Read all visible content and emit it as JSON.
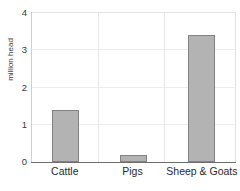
{
  "chart_data": {
    "type": "bar",
    "title": "",
    "xlabel": "",
    "ylabel": "million head",
    "categories": [
      "Cattle",
      "Pigs",
      "Sheep & Goats"
    ],
    "values": [
      1.4,
      0.2,
      3.4
    ],
    "series": [
      {
        "name": "million head",
        "values": [
          1.4,
          0.2,
          3.4
        ]
      }
    ],
    "ylim": [
      0,
      4
    ],
    "yticks": [
      0,
      1,
      2,
      3,
      4
    ],
    "ytick_labels": [
      "0",
      "1",
      "2",
      "3",
      "4"
    ],
    "grid": true,
    "grid_axis": "y",
    "legend": false,
    "legend_position": "none",
    "bar_color": "#b3b3b3",
    "bar_edge_color": "#838383",
    "grid_color": "#ededed",
    "axis_color": "#6e6e6e",
    "text_color": "#2b2b2b"
  },
  "axis": {
    "y_title": "million head",
    "ticks": [
      {
        "label": "4",
        "value": 4
      },
      {
        "label": "3",
        "value": 3
      },
      {
        "label": "2",
        "value": 2
      },
      {
        "label": "1",
        "value": 1
      },
      {
        "label": "0",
        "value": 0
      }
    ]
  },
  "bars": [
    {
      "label": "Cattle",
      "value": 1.4
    },
    {
      "label": "Pigs",
      "value": 0.2
    },
    {
      "label": "Sheep & Goats",
      "value": 3.4
    }
  ]
}
